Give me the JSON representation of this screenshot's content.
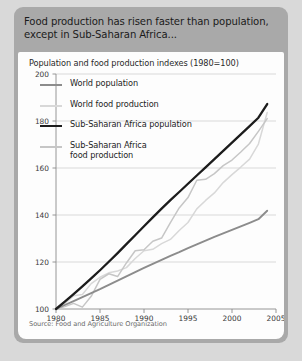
{
  "headline": "Food production has risen faster than population, except in Sub-Saharan Africa...",
  "source": "Source: Food and Agriculture Organization",
  "colors": {
    "card_background": "#a9a9a9",
    "panel_background": "#fdfdfd",
    "world_population": "#8c8c8c",
    "world_food_production": "#d8d8d8",
    "ssa_population": "#1c1c1c",
    "ssa_food_production": "#c6c6c6",
    "gridline": "#cfcfcf",
    "axis": "#8a8a8a"
  },
  "legend": {
    "items": [
      {
        "label": "World population",
        "color": "#8c8c8c",
        "thick": false
      },
      {
        "label": "World food production",
        "color": "#d8d8d8",
        "thick": false
      },
      {
        "label": "Sub-Saharan Africa population",
        "color": "#1c1c1c",
        "thick": true
      },
      {
        "label": "Sub-Saharan Africa food production",
        "color": "#c6c6c6",
        "thick": false
      }
    ]
  },
  "chart_data": {
    "type": "line",
    "title": "Food production has risen faster than population, except in Sub-Saharan Africa...",
    "subtitle": "Population and food production indexes (1980=100)",
    "xlabel": "",
    "ylabel": "",
    "xlim": [
      1980,
      2005
    ],
    "ylim": [
      100,
      200
    ],
    "xticks": [
      1980,
      1985,
      1990,
      1995,
      2000,
      2005
    ],
    "yticks": [
      100,
      120,
      140,
      160,
      180,
      200
    ],
    "grid": true,
    "legend_position": "upper-left-inside",
    "source": "Source: Food and Agriculture Organization",
    "x": [
      1980,
      1981,
      1982,
      1983,
      1984,
      1985,
      1986,
      1987,
      1988,
      1989,
      1990,
      1991,
      1992,
      1993,
      1994,
      1995,
      1996,
      1997,
      1998,
      1999,
      2000,
      2001,
      2002,
      2003,
      2004
    ],
    "series": [
      {
        "name": "World population",
        "color": "#8c8c8c",
        "values": [
          100,
          101.7,
          103.4,
          105.1,
          106.8,
          108.5,
          110.3,
          112.1,
          113.9,
          115.7,
          117.5,
          119.2,
          120.9,
          122.6,
          124.2,
          125.9,
          127.5,
          129.1,
          130.7,
          132.2,
          133.7,
          135.2,
          136.7,
          138.2,
          141.8
        ]
      },
      {
        "name": "World food production",
        "color": "#d8d8d8",
        "values": [
          100,
          102.4,
          105.6,
          106.2,
          110.8,
          113.5,
          115.4,
          116.2,
          117.6,
          121.5,
          124.8,
          125.4,
          127.8,
          129.6,
          133.4,
          136.8,
          142.6,
          146.2,
          149.4,
          153.8,
          157.2,
          160.4,
          163.8,
          170.2,
          183.6
        ]
      },
      {
        "name": "Sub-Saharan Africa population",
        "color": "#1c1c1c",
        "values": [
          100,
          103.1,
          106.3,
          109.6,
          113.0,
          116.5,
          120.1,
          123.8,
          127.6,
          131.4,
          135.2,
          139.0,
          142.7,
          146.3,
          149.8,
          153.3,
          156.8,
          160.3,
          163.8,
          167.3,
          170.8,
          174.3,
          177.8,
          181.4,
          187.2
        ]
      },
      {
        "name": "Sub-Saharan Africa food production",
        "color": "#c6c6c6",
        "values": [
          100,
          101.0,
          102.4,
          100.8,
          105.4,
          112.6,
          115.0,
          113.8,
          119.6,
          124.8,
          125.2,
          128.8,
          130.2,
          136.8,
          143.0,
          147.4,
          154.8,
          155.2,
          157.6,
          161.0,
          163.4,
          166.8,
          170.4,
          175.6,
          181.0
        ]
      }
    ]
  }
}
